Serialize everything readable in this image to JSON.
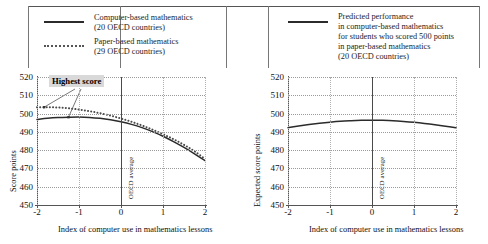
{
  "legend": {
    "entries": [
      {
        "id": "computer-based",
        "style": "solid",
        "lines": [
          "Computer-based mathematics",
          "(20 OECD countries)"
        ]
      },
      {
        "id": "paper-based",
        "style": "dotted",
        "lines": [
          "Paper-based mathematics",
          "(29 OECD countries)"
        ]
      },
      {
        "id": "predicted-performance",
        "style": "solid",
        "lines": [
          "Predicted performance",
          "in computer-based mathematics",
          "for students who scored 500 points",
          "in paper-based mathematics",
          "(20 OECD countries)"
        ]
      }
    ]
  },
  "chart_data": [
    {
      "id": "left-panel",
      "type": "line",
      "title": "",
      "xlabel": "Index of computer use in mathematics lessons",
      "ylabel": "Score points",
      "xlim": [
        -2,
        2
      ],
      "ylim": [
        450,
        520
      ],
      "xticks": [
        "-2",
        "-1",
        "0",
        "1",
        "2"
      ],
      "yticks": [
        "450",
        "460",
        "470",
        "480",
        "490",
        "500",
        "510",
        "520"
      ],
      "grid": true,
      "legend_position": "external-top",
      "annotations": [
        {
          "id": "highest-score",
          "text": "Highest score",
          "points_to": [
            [
              -1.83,
              503.5
            ],
            [
              -1.25,
              498.0
            ]
          ]
        },
        {
          "id": "oecd-average",
          "text": "OECD average",
          "x": 0
        }
      ],
      "series": [
        {
          "name": "Computer-based mathematics",
          "style": "solid",
          "color": "#2b2b2b",
          "x": [
            -2.0,
            -1.75,
            -1.5,
            -1.25,
            -1.0,
            -0.75,
            -0.5,
            -0.25,
            0.0,
            0.25,
            0.5,
            0.75,
            1.0,
            1.25,
            1.5,
            1.75,
            2.0
          ],
          "y": [
            496.8,
            497.4,
            497.8,
            498.0,
            498.1,
            497.9,
            497.4,
            496.6,
            495.5,
            494.1,
            492.3,
            490.1,
            487.6,
            484.7,
            481.5,
            478.0,
            474.3
          ]
        },
        {
          "name": "Paper-based mathematics",
          "style": "dotted",
          "color": "#4a4a4a",
          "x": [
            -2.0,
            -1.75,
            -1.5,
            -1.25,
            -1.0,
            -0.75,
            -0.5,
            -0.25,
            0.0,
            0.25,
            0.5,
            0.75,
            1.0,
            1.25,
            1.5,
            1.75,
            2.0
          ],
          "y": [
            503.4,
            503.5,
            503.3,
            502.9,
            502.2,
            501.3,
            500.2,
            498.9,
            497.3,
            495.5,
            493.5,
            491.2,
            488.7,
            486.0,
            482.9,
            479.4,
            475.2
          ]
        }
      ]
    },
    {
      "id": "right-panel",
      "type": "line",
      "title": "",
      "xlabel": "Index of computer use in mathematics lessons",
      "ylabel": "Expected score points",
      "xlim": [
        -2,
        2
      ],
      "ylim": [
        450,
        520
      ],
      "xticks": [
        "-2",
        "-1",
        "0",
        "1",
        "2"
      ],
      "yticks": [
        "450",
        "460",
        "470",
        "480",
        "490",
        "500",
        "510",
        "520"
      ],
      "grid": true,
      "legend_position": "external-top",
      "annotations": [
        {
          "id": "oecd-average",
          "text": "OECD average",
          "x": 0
        }
      ],
      "series": [
        {
          "name": "Predicted performance in computer-based mathematics for students who scored 500 points in paper-based mathematics",
          "style": "solid",
          "color": "#2b2b2b",
          "x": [
            -2.0,
            -1.75,
            -1.5,
            -1.25,
            -1.0,
            -0.75,
            -0.5,
            -0.25,
            0.0,
            0.25,
            0.5,
            0.75,
            1.0,
            1.25,
            1.5,
            1.75,
            2.0
          ],
          "y": [
            492.3,
            493.2,
            494.0,
            494.7,
            495.3,
            495.8,
            496.1,
            496.3,
            496.4,
            496.3,
            496.1,
            495.7,
            495.2,
            494.6,
            493.9,
            493.1,
            492.2
          ]
        }
      ]
    }
  ]
}
